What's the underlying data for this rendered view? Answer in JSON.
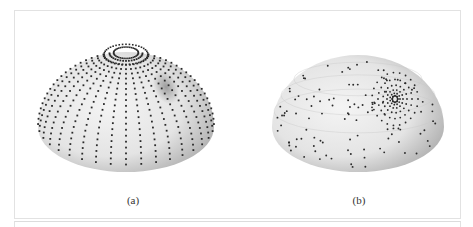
{
  "figure": {
    "panels": [
      {
        "id": "a",
        "label": "(a)",
        "description": "Hemisphere with points on meridian lines and latitude rings near pole; shaded bump"
      },
      {
        "id": "b",
        "label": "(b)",
        "description": "Hemisphere with scattered points and concentric clustering around a focus point"
      }
    ]
  },
  "colors": {
    "sphere_light": "#f4f4f4",
    "sphere_mid": "#d2d2d2",
    "sphere_dark": "#a8a8a8",
    "dot": "#2a2a2a",
    "grid": "#c8c8c8",
    "frame": "#e2e2e2"
  }
}
